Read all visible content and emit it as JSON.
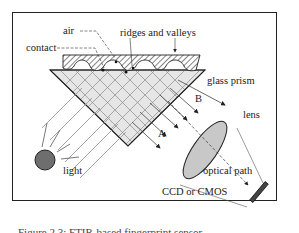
{
  "diagram": {
    "labels": {
      "air": "air",
      "ridges_valleys": "ridges and valleys",
      "contact": "contact",
      "glass_prism": "glass prism",
      "path_b": "B",
      "path_a": "A",
      "lens": "lens",
      "light": "light",
      "optical_path": "optical path",
      "sensor": "CCD or CMOS"
    },
    "caption": "Figure 2.3: FTIR-based fingerprint sensor",
    "colors": {
      "frame": "#222222",
      "prism_fill": "#e6e6e6",
      "lens_fill": "#c8c8c8",
      "light_fill": "#6e6e6e",
      "sensor_fill": "#444444",
      "rays": "#999999"
    }
  }
}
